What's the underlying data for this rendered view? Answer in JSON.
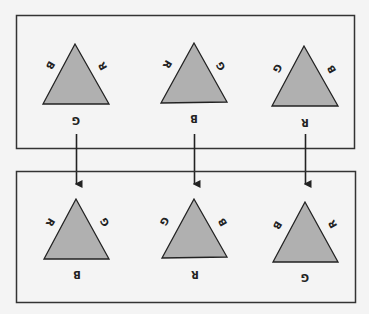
{
  "colors": {
    "background": "#f4f4f4",
    "stroke": "#222222",
    "triangle_fill": "#b0b0b0"
  },
  "top_row": {
    "triangles": [
      {
        "left": "B",
        "right": "R",
        "bottom": "G"
      },
      {
        "left": "R",
        "right": "G",
        "bottom": "B"
      },
      {
        "left": "G",
        "right": "B",
        "bottom": "R"
      }
    ]
  },
  "bottom_row": {
    "triangles": [
      {
        "left": "R",
        "right": "G",
        "bottom": "B"
      },
      {
        "left": "G",
        "right": "B",
        "bottom": "R"
      },
      {
        "left": "B",
        "right": "R",
        "bottom": "G"
      }
    ]
  },
  "arrows": [
    {
      "from": "top_row.triangles.0",
      "to": "bottom_row.triangles.0"
    },
    {
      "from": "top_row.triangles.1",
      "to": "bottom_row.triangles.1"
    },
    {
      "from": "top_row.triangles.2",
      "to": "bottom_row.triangles.2"
    }
  ]
}
